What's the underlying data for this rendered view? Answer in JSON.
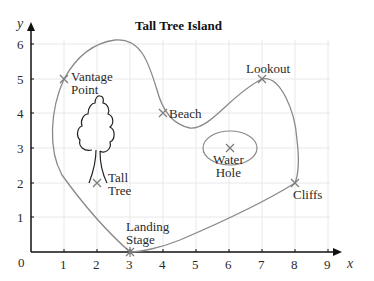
{
  "title": "Tall Tree Island",
  "axes": {
    "x_label": "x",
    "y_label": "y",
    "origin_label": "0",
    "x_ticks": [
      "1",
      "2",
      "3",
      "4",
      "5",
      "6",
      "7",
      "8",
      "9"
    ],
    "y_ticks": [
      "1",
      "2",
      "3",
      "4",
      "5",
      "6"
    ]
  },
  "places": [
    {
      "id": "vantage-point",
      "line1": "Vantage",
      "line2": "Point",
      "x": 1,
      "y": 5
    },
    {
      "id": "beach",
      "line1": "Beach",
      "line2": "",
      "x": 4,
      "y": 4
    },
    {
      "id": "lookout",
      "line1": "Lookout",
      "line2": "",
      "x": 7,
      "y": 5
    },
    {
      "id": "water-hole",
      "line1": "Water",
      "line2": "Hole",
      "x": 6,
      "y": 3
    },
    {
      "id": "tall-tree",
      "line1": "Tall",
      "line2": "Tree",
      "x": 2,
      "y": 2
    },
    {
      "id": "cliffs",
      "line1": "Cliffs",
      "line2": "",
      "x": 8,
      "y": 2
    },
    {
      "id": "landing-stage",
      "line1": "Landing",
      "line2": "Stage",
      "x": 3,
      "y": 0
    }
  ],
  "colors": {
    "coast": "#8a8a8a",
    "grid": "#e6e6e6",
    "axis": "#111111"
  }
}
